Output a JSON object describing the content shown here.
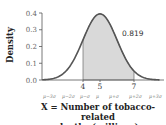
{
  "chart_data": {
    "type": "area",
    "title": "",
    "distribution": "normal",
    "mu": 5,
    "sigma": 1,
    "xlabel": "X = Number of tobacco-related deaths (millions)",
    "ylabel": "Density",
    "ylim": [
      0.0,
      0.4
    ],
    "yticks": [
      "0.0",
      "0.1",
      "0.2",
      "0.3",
      "0.4"
    ],
    "xticks_numeric": [
      "4",
      "5",
      "7"
    ],
    "xticks_symbolic": [
      "μ−3σ",
      "μ−2σ",
      "μ−σ",
      "μ",
      "μ+σ",
      "μ+2σ",
      "μ+3σ"
    ],
    "shaded_region": {
      "from": 4,
      "to": 7,
      "probability": 0.819
    },
    "annotation": "0.819",
    "grid": false,
    "colors": {
      "curve": "#555555",
      "fill": "#d9d9d9",
      "axis": "#555555"
    }
  },
  "labels": {
    "ylabel": "Density",
    "xtitle_line1": "X = Number of tobacco-related",
    "xtitle_line2": "deaths (millions)",
    "annotation": "0.819"
  }
}
